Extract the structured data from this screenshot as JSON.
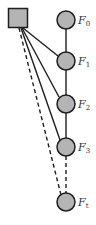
{
  "diagram": {
    "type": "graph",
    "colors": {
      "node_fill": "#b4b4b4",
      "node_stroke": "#1e1e1e",
      "edge": "#1e1e1e",
      "label": "#333333"
    },
    "hub": {
      "shape": "square",
      "label": ""
    },
    "nodes": [
      {
        "id": "F0",
        "base": "F",
        "sub": "0"
      },
      {
        "id": "F1",
        "base": "F",
        "sub": "1"
      },
      {
        "id": "F2",
        "base": "F",
        "sub": "2"
      },
      {
        "id": "F3",
        "base": "F",
        "sub": "3"
      },
      {
        "id": "Ft",
        "base": "F",
        "sub": "t"
      }
    ],
    "edges": [
      {
        "from": "F0",
        "to": "F1",
        "style": "solid"
      },
      {
        "from": "F1",
        "to": "F2",
        "style": "solid"
      },
      {
        "from": "F2",
        "to": "F3",
        "style": "solid"
      },
      {
        "from": "F3",
        "to": "Ft",
        "style": "dashed"
      },
      {
        "from": "hub",
        "to": "F1",
        "style": "solid"
      },
      {
        "from": "hub",
        "to": "F2",
        "style": "solid"
      },
      {
        "from": "hub",
        "to": "F3",
        "style": "solid"
      },
      {
        "from": "hub",
        "to": "Ft",
        "style": "dashed"
      }
    ]
  }
}
